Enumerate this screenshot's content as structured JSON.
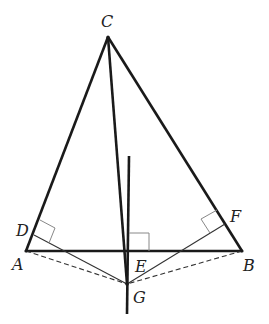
{
  "diagram": {
    "type": "geometry",
    "colors": {
      "stroke": "#1a1a1a",
      "thin": "#333333",
      "marker": "#888888"
    },
    "points": {
      "A": {
        "label": "A",
        "x": 26,
        "y": 251
      },
      "B": {
        "label": "B",
        "x": 242,
        "y": 251
      },
      "C": {
        "label": "C",
        "x": 108,
        "y": 37
      },
      "D": {
        "label": "D",
        "x": 34,
        "y": 235
      },
      "E": {
        "label": "E",
        "x": 128,
        "y": 251
      },
      "F": {
        "label": "F",
        "x": 225,
        "y": 224
      },
      "G": {
        "label": "G",
        "x": 127,
        "y": 284
      }
    },
    "segments": [
      {
        "from": "A",
        "to": "B",
        "style": "solid-thick"
      },
      {
        "from": "A",
        "to": "C",
        "style": "solid-thick"
      },
      {
        "from": "B",
        "to": "C",
        "style": "solid-thick"
      },
      {
        "from": "C",
        "to": "G",
        "style": "solid-thick"
      },
      {
        "from": "D",
        "to": "G",
        "style": "solid-thin"
      },
      {
        "from": "F",
        "to": "G",
        "style": "solid-thin"
      },
      {
        "from": "A",
        "to": "G",
        "style": "dashed"
      },
      {
        "from": "B",
        "to": "G",
        "style": "dashed"
      },
      {
        "from": "perp-top",
        "to": "perp-bottom",
        "style": "solid-thick",
        "note": "vertical line through E"
      }
    ],
    "right_angles": [
      "D",
      "E",
      "F"
    ]
  }
}
